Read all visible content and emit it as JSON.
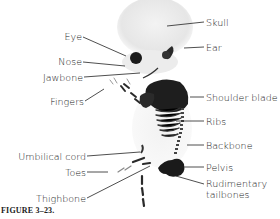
{
  "figure": {
    "caption": "FIGURE 3–23.",
    "labels_left": [
      {
        "id": "eye",
        "text": "Eye"
      },
      {
        "id": "nose",
        "text": "Nose"
      },
      {
        "id": "jawbone",
        "text": "Jawbone"
      },
      {
        "id": "fingers",
        "text": "Fingers"
      },
      {
        "id": "umbilical-cord",
        "text": "Umbilical cord"
      },
      {
        "id": "toes",
        "text": "Toes"
      },
      {
        "id": "thighbone",
        "text": "Thighbone"
      }
    ],
    "labels_right": [
      {
        "id": "skull",
        "text": "Skull"
      },
      {
        "id": "ear",
        "text": "Ear"
      },
      {
        "id": "shoulder-blade",
        "text": "Shoulder blade"
      },
      {
        "id": "ribs",
        "text": "Ribs"
      },
      {
        "id": "backbone",
        "text": "Backbone"
      },
      {
        "id": "pelvis",
        "text": "Pelvis"
      },
      {
        "id": "rudimentary-tailbones",
        "text": "Rudimentary\ntailbones",
        "line1": "Rudimentary",
        "line2": "tailbones"
      }
    ]
  }
}
